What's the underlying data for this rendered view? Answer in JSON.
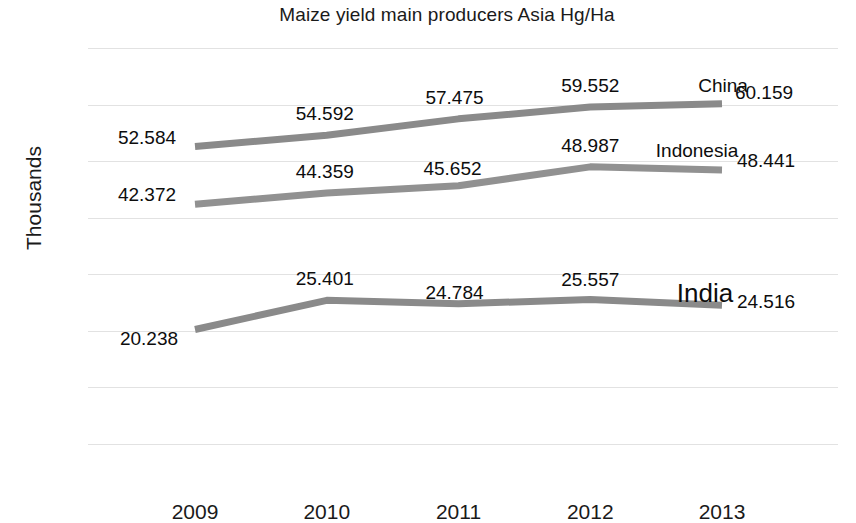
{
  "chart_data": {
    "type": "line",
    "title": "Maize yield main producers Asia Hg/Ha",
    "xlabel": "",
    "ylabel": "Thousands",
    "categories": [
      "2009",
      "2010",
      "2011",
      "2012",
      "2013"
    ],
    "ylim": [
      0,
      70
    ],
    "yticks": [
      "0",
      "10",
      "20",
      "30",
      "40",
      "50",
      "60",
      "70"
    ],
    "grid": true,
    "legend_position": "inline-end-of-line",
    "series": [
      {
        "name": "China",
        "color": "#8a8a8a",
        "values": [
          52.584,
          54.592,
          57.475,
          59.552,
          60.159
        ],
        "labels": [
          "52.584",
          "54.592",
          "57.475",
          "59.552",
          "60.159"
        ]
      },
      {
        "name": "Indonesia",
        "color": "#919191",
        "values": [
          42.372,
          44.359,
          45.652,
          48.987,
          48.441
        ],
        "labels": [
          "42.372",
          "44.359",
          "45.652",
          "48.987",
          "48.441"
        ]
      },
      {
        "name": "India",
        "color": "#8a8a8a",
        "values": [
          20.238,
          25.401,
          24.784,
          25.557,
          24.516
        ],
        "labels": [
          "20.238",
          "25.401",
          "24.784",
          "25.557",
          "24.516"
        ]
      }
    ]
  },
  "axis": {
    "yticks": [
      {
        "label": "70"
      },
      {
        "label": "60"
      },
      {
        "label": "50"
      },
      {
        "label": "40"
      },
      {
        "label": "30"
      },
      {
        "label": "20"
      },
      {
        "label": "10"
      },
      {
        "label": "0"
      }
    ],
    "xticks": [
      {
        "label": "2009"
      },
      {
        "label": "2010"
      },
      {
        "label": "2011"
      },
      {
        "label": "2012"
      },
      {
        "label": "2013"
      }
    ]
  },
  "series_labels": [
    {
      "text": "China"
    },
    {
      "text": "Indonesia"
    },
    {
      "text": "India"
    }
  ],
  "data_labels": {
    "china": [
      "52.584",
      "54.592",
      "57.475",
      "59.552",
      "60.159"
    ],
    "indonesia": [
      "42.372",
      "44.359",
      "45.652",
      "48.987",
      "48.441"
    ],
    "india": [
      "20.238",
      "25.401",
      "24.784",
      "25.557",
      "24.516"
    ]
  }
}
